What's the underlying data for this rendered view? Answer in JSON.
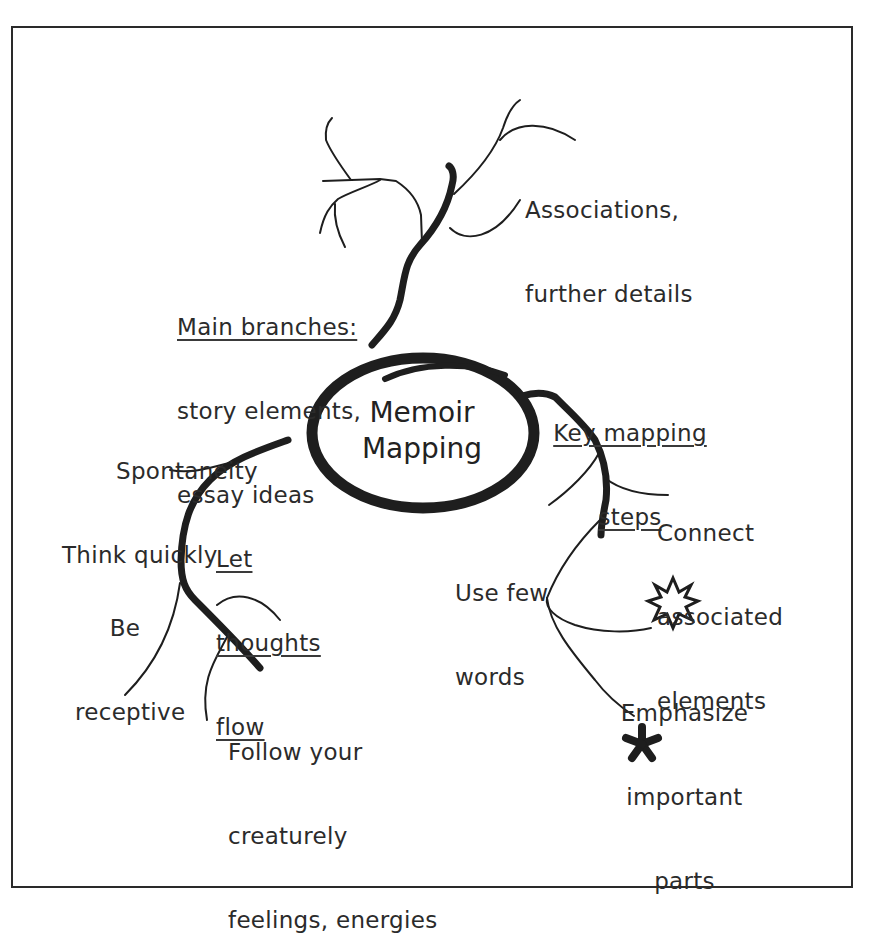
{
  "diagram": {
    "type": "mind-map",
    "center": {
      "lines": [
        "Memoir",
        "Mapping"
      ]
    },
    "labels": {
      "associations": {
        "lines": [
          "Associations,",
          "further details"
        ]
      },
      "main_branches": {
        "heading": "Main branches:",
        "lines": [
          "story elements,",
          "essay ideas"
        ]
      },
      "key_steps": {
        "lines": [
          "Key mapping",
          "steps"
        ]
      },
      "connect": {
        "lines": [
          "Connect",
          "associated",
          "elements"
        ]
      },
      "use_few": {
        "lines": [
          "Use few",
          "words"
        ]
      },
      "emphasize": {
        "lines": [
          "Emphasize",
          "important",
          "parts"
        ]
      },
      "spontaneity": {
        "lines": [
          "Spontaneity",
          "Think quickly"
        ]
      },
      "let_flow": {
        "lines": [
          "Let",
          "thoughts",
          "flow"
        ]
      },
      "receptive": {
        "lines": [
          "Be",
          "receptive"
        ]
      },
      "follow": {
        "lines": [
          "Follow your",
          "creaturely",
          "feelings, energies"
        ]
      }
    },
    "icons": {
      "starburst": "starburst-icon",
      "asterisk": "asterisk-icon"
    },
    "colors": {
      "ink": "#1e1e1e",
      "frame": "#2a2a2a",
      "background": "#ffffff"
    }
  }
}
